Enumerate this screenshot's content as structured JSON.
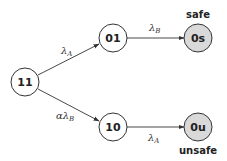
{
  "diagram": {
    "type": "state-transition",
    "nodes": [
      {
        "id": "11",
        "label": "11",
        "absorbing": false
      },
      {
        "id": "01",
        "label": "01",
        "absorbing": false
      },
      {
        "id": "10",
        "label": "10",
        "absorbing": false
      },
      {
        "id": "0s",
        "label": "0s",
        "absorbing": true,
        "tag": "safe"
      },
      {
        "id": "0u",
        "label": "0u",
        "absorbing": true,
        "tag": "unsafe"
      }
    ],
    "edges": [
      {
        "from": "11",
        "to": "01",
        "rate_main": "λ",
        "rate_prefix": "",
        "rate_sub": "A"
      },
      {
        "from": "11",
        "to": "10",
        "rate_main": "λ",
        "rate_prefix": "α",
        "rate_sub": "B"
      },
      {
        "from": "01",
        "to": "0s",
        "rate_main": "λ",
        "rate_prefix": "",
        "rate_sub": "B"
      },
      {
        "from": "10",
        "to": "0u",
        "rate_main": "λ",
        "rate_prefix": "",
        "rate_sub": "A"
      }
    ],
    "colors": {
      "normal_fill": "#ffffff",
      "absorbing_fill": "#d9d9d9",
      "stroke": "#333333"
    }
  }
}
